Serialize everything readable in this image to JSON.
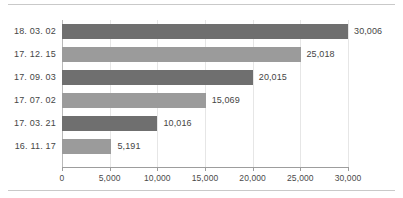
{
  "figure": {
    "background_color": "#ffffff",
    "top_rule_color": "#c9c9c9",
    "bottom_rule_color": "#c9c9c9"
  },
  "chart_data": {
    "type": "bar",
    "orientation": "horizontal",
    "title": "",
    "subtitle": "",
    "xlabel": "",
    "ylabel": "",
    "categories": [
      "18. 03. 02",
      "17. 12. 15",
      "17. 09. 03",
      "17. 07. 02",
      "17. 03. 21",
      "16. 11. 17"
    ],
    "values": [
      30006,
      25018,
      20015,
      15069,
      10016,
      5191
    ],
    "data_labels": [
      "30,006",
      "25,018",
      "20,015",
      "15,069",
      "10,016",
      "5,191"
    ],
    "bar_colors": [
      "#6f6f6f",
      "#9b9b9b",
      "#6f6f6f",
      "#9b9b9b",
      "#6f6f6f",
      "#9b9b9b"
    ],
    "xlim": [
      0,
      30000
    ],
    "xticks": [
      0,
      5000,
      10000,
      15000,
      20000,
      25000,
      30000
    ],
    "xticklabels": [
      "0",
      "5,000",
      "10,000",
      "15,000",
      "20,000",
      "25,000",
      "30,000"
    ],
    "grid": "vertical",
    "grid_color": "#e6e6e6",
    "axis_color": "#9d9d9d",
    "legend": "none",
    "legend_position": "none",
    "annotations": []
  }
}
